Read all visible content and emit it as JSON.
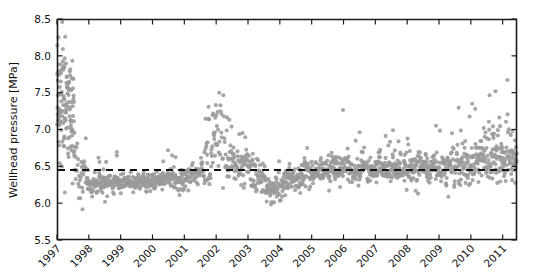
{
  "chart_data": {
    "type": "scatter",
    "title": "",
    "xlabel": "",
    "ylabel": "Wellhead pressure [MPa]",
    "xlim": [
      1997.0,
      2011.45
    ],
    "ylim": [
      5.5,
      8.5
    ],
    "grid": false,
    "legend": null,
    "marker_color": "#9a9a9a",
    "marker_size_px": 3.0,
    "xticks": [
      1997,
      1998,
      1999,
      2000,
      2001,
      2002,
      2003,
      2004,
      2005,
      2006,
      2007,
      2008,
      2009,
      2010,
      2011
    ],
    "xtick_labels": [
      "1997",
      "1998",
      "1999",
      "2000",
      "2001",
      "2002",
      "2003",
      "2004",
      "2005",
      "2006",
      "2007",
      "2008",
      "2009",
      "2010",
      "2011"
    ],
    "xtick_rotation_deg": -45,
    "yticks": [
      5.5,
      6.0,
      6.5,
      7.0,
      7.5,
      8.0,
      8.5
    ],
    "ytick_labels": [
      "5.5",
      "6.0",
      "6.5",
      "7.0",
      "7.5",
      "8.0",
      "8.5"
    ],
    "annotations": [
      {
        "name": "mean-reference-line",
        "type": "hline",
        "y": 6.45,
        "style": "dashed",
        "color": "#111111",
        "label": ""
      }
    ],
    "series": [
      {
        "name": "Wellhead pressure measurements",
        "marker": "o",
        "color": "#9a9a9a",
        "description": "Dense daily scatter of wellhead pressure; very high and highly scattered in 1997 (6.0-8.3 MPa), dropping to a tight band near 6.2-6.4 MPa during 1998-2001, a large excursion up to ~7.7 MPa in 2002, a dip to ~6.0 in late 2003/2004, then a stable band near the 6.45 MPa reference through 2005-2009, with increasing upward scatter to ~7.8 MPa in 2010-2011.",
        "segments": [
          {
            "t0": 1997.0,
            "t1": 1997.55,
            "base0": 7.55,
            "base1": 7.05,
            "spread": 0.42,
            "up": 0.62,
            "down": 0.55,
            "density": 230,
            "outlier_rate": 0.16,
            "outlier_up": 0.7,
            "outlier_down": 1.1
          },
          {
            "t0": 1997.55,
            "t1": 1997.95,
            "base0": 6.55,
            "base1": 6.3,
            "spread": 0.16,
            "up": 0.22,
            "down": 0.4,
            "density": 85,
            "outlier_rate": 0.2,
            "outlier_up": 0.45,
            "outlier_down": 0.6
          },
          {
            "t0": 1997.95,
            "t1": 1999.0,
            "base0": 6.27,
            "base1": 6.28,
            "spread": 0.07,
            "up": 0.1,
            "down": 0.12,
            "density": 115,
            "outlier_rate": 0.05,
            "outlier_up": 0.45,
            "outlier_down": 0.35
          },
          {
            "t0": 1999.0,
            "t1": 2000.1,
            "base0": 6.28,
            "base1": 6.3,
            "spread": 0.06,
            "up": 0.09,
            "down": 0.1,
            "density": 115,
            "outlier_rate": 0.04,
            "outlier_up": 0.4,
            "outlier_down": 0.3
          },
          {
            "t0": 2000.1,
            "t1": 2001.05,
            "base0": 6.3,
            "base1": 6.33,
            "spread": 0.07,
            "up": 0.12,
            "down": 0.12,
            "density": 115,
            "outlier_rate": 0.05,
            "outlier_up": 0.45,
            "outlier_down": 0.32
          },
          {
            "t0": 2001.05,
            "t1": 2001.6,
            "base0": 6.34,
            "base1": 6.45,
            "spread": 0.09,
            "up": 0.18,
            "down": 0.14,
            "density": 95,
            "outlier_rate": 0.08,
            "outlier_up": 0.5,
            "outlier_down": 0.3
          },
          {
            "t0": 2001.6,
            "t1": 2002.05,
            "base0": 6.48,
            "base1": 6.85,
            "spread": 0.2,
            "up": 0.45,
            "down": 0.35,
            "density": 95,
            "outlier_rate": 0.14,
            "outlier_up": 0.55,
            "outlier_down": 0.35
          },
          {
            "t0": 2002.05,
            "t1": 2002.35,
            "base0": 6.95,
            "base1": 6.72,
            "spread": 0.26,
            "up": 0.5,
            "down": 0.45,
            "density": 80,
            "outlier_rate": 0.18,
            "outlier_up": 0.55,
            "outlier_down": 0.45
          },
          {
            "t0": 2002.35,
            "t1": 2002.95,
            "base0": 6.6,
            "base1": 6.55,
            "spread": 0.17,
            "up": 0.32,
            "down": 0.28,
            "density": 100,
            "outlier_rate": 0.12,
            "outlier_up": 0.45,
            "outlier_down": 0.35
          },
          {
            "t0": 2002.95,
            "t1": 2003.55,
            "base0": 6.5,
            "base1": 6.3,
            "spread": 0.13,
            "up": 0.22,
            "down": 0.25,
            "density": 100,
            "outlier_rate": 0.1,
            "outlier_up": 0.4,
            "outlier_down": 0.35
          },
          {
            "t0": 2003.55,
            "t1": 2004.1,
            "base0": 6.22,
            "base1": 6.2,
            "spread": 0.1,
            "up": 0.16,
            "down": 0.22,
            "density": 100,
            "outlier_rate": 0.08,
            "outlier_up": 0.35,
            "outlier_down": 0.4
          },
          {
            "t0": 2004.1,
            "t1": 2005.0,
            "base0": 6.28,
            "base1": 6.42,
            "spread": 0.1,
            "up": 0.18,
            "down": 0.16,
            "density": 110,
            "outlier_rate": 0.07,
            "outlier_up": 0.4,
            "outlier_down": 0.3
          },
          {
            "t0": 2005.0,
            "t1": 2006.0,
            "base0": 6.44,
            "base1": 6.46,
            "spread": 0.09,
            "up": 0.2,
            "down": 0.13,
            "density": 115,
            "outlier_rate": 0.08,
            "outlier_up": 0.45,
            "outlier_down": 0.28
          },
          {
            "t0": 2006.0,
            "t1": 2007.0,
            "base0": 6.46,
            "base1": 6.47,
            "spread": 0.09,
            "up": 0.22,
            "down": 0.13,
            "density": 115,
            "outlier_rate": 0.09,
            "outlier_up": 0.48,
            "outlier_down": 0.28
          },
          {
            "t0": 2007.0,
            "t1": 2008.0,
            "base0": 6.47,
            "base1": 6.46,
            "spread": 0.1,
            "up": 0.24,
            "down": 0.14,
            "density": 115,
            "outlier_rate": 0.1,
            "outlier_up": 0.52,
            "outlier_down": 0.3
          },
          {
            "t0": 2008.0,
            "t1": 2009.0,
            "base0": 6.46,
            "base1": 6.48,
            "spread": 0.1,
            "up": 0.26,
            "down": 0.14,
            "density": 115,
            "outlier_rate": 0.1,
            "outlier_up": 0.55,
            "outlier_down": 0.32
          },
          {
            "t0": 2009.0,
            "t1": 2009.7,
            "base0": 6.48,
            "base1": 6.52,
            "spread": 0.12,
            "up": 0.35,
            "down": 0.15,
            "density": 100,
            "outlier_rate": 0.14,
            "outlier_up": 0.6,
            "outlier_down": 0.35
          },
          {
            "t0": 2009.7,
            "t1": 2010.45,
            "base0": 6.54,
            "base1": 6.58,
            "spread": 0.16,
            "up": 0.48,
            "down": 0.18,
            "density": 110,
            "outlier_rate": 0.18,
            "outlier_up": 0.75,
            "outlier_down": 0.4
          },
          {
            "t0": 2010.45,
            "t1": 2011.45,
            "base0": 6.58,
            "base1": 6.62,
            "spread": 0.18,
            "up": 0.6,
            "down": 0.2,
            "density": 120,
            "outlier_rate": 0.2,
            "outlier_up": 0.9,
            "outlier_down": 0.45
          }
        ]
      }
    ]
  },
  "layout": {
    "plot_left": 57,
    "plot_right": 517,
    "plot_top": 19,
    "plot_bottom": 240
  }
}
